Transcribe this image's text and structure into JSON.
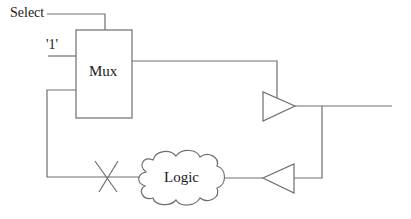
{
  "diagram": {
    "type": "circuit-block-diagram",
    "labels": {
      "select": "Select",
      "constant_one": "'1'",
      "mux": "Mux",
      "logic": "Logic"
    },
    "components": [
      {
        "id": "mux",
        "shape": "rectangle",
        "label": "Mux"
      },
      {
        "id": "buffer-forward",
        "shape": "triangle-right",
        "label": ""
      },
      {
        "id": "buffer-feedback",
        "shape": "triangle-left",
        "label": ""
      },
      {
        "id": "logic",
        "shape": "cloud",
        "label": "Logic"
      },
      {
        "id": "cut-mark",
        "shape": "x-mark",
        "label": ""
      }
    ],
    "connections": [
      {
        "from": "Select",
        "to": "mux"
      },
      {
        "from": "'1'",
        "to": "mux"
      },
      {
        "from": "mux",
        "to": "buffer-forward"
      },
      {
        "from": "buffer-forward",
        "to": "output"
      },
      {
        "from": "buffer-forward",
        "to": "buffer-feedback"
      },
      {
        "from": "buffer-feedback",
        "to": "logic"
      },
      {
        "from": "logic",
        "to": "mux",
        "via": "cut-mark"
      }
    ],
    "colors": {
      "stroke": "#6e6e6e",
      "text": "#1a1a1a",
      "background": "#ffffff"
    }
  }
}
